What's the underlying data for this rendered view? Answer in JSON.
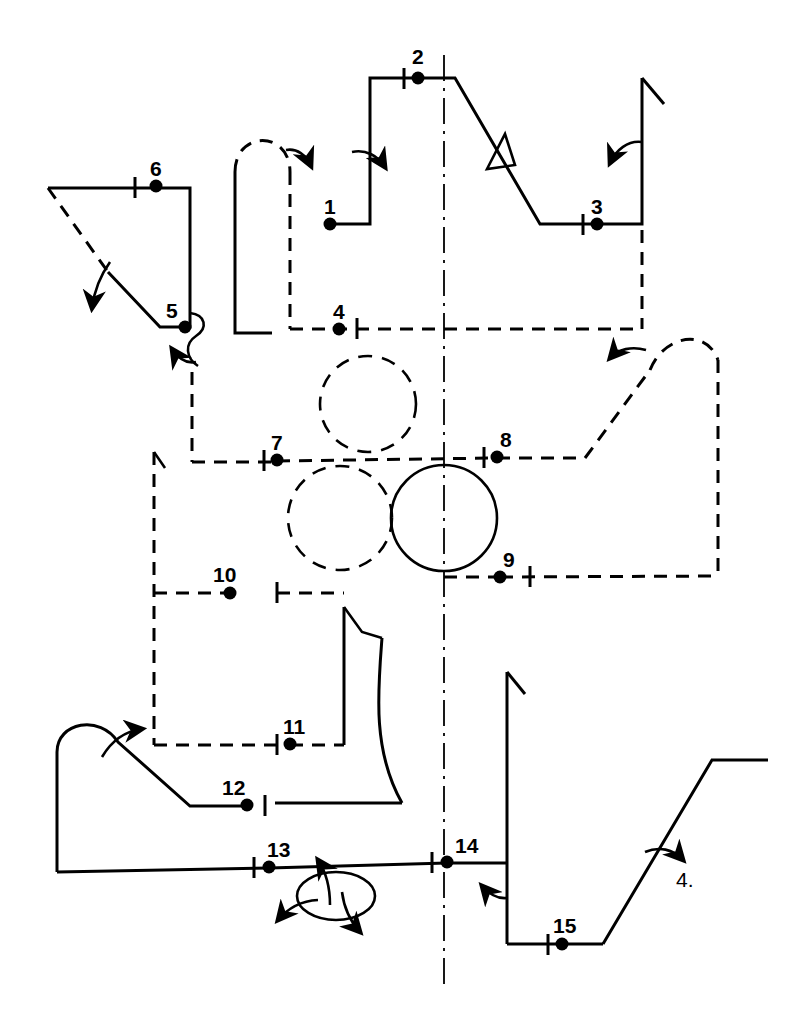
{
  "diagram": {
    "canvas": {
      "width": 803,
      "height": 1032
    },
    "colors": {
      "stroke": "#000000",
      "background": "#ffffff"
    },
    "centerline": {
      "name": "vertical-centerline",
      "x": 444,
      "y_start": 55,
      "y_end": 988,
      "style": "dash-dot"
    },
    "nodes": [
      {
        "id": "1",
        "label": "1",
        "x": 330,
        "y": 224,
        "label_x": 324,
        "label_y": 196
      },
      {
        "id": "2",
        "label": "2",
        "x": 418,
        "y": 78,
        "label_x": 412,
        "label_y": 46
      },
      {
        "id": "3",
        "label": "3",
        "x": 597,
        "y": 224,
        "label_x": 591,
        "label_y": 196
      },
      {
        "id": "4",
        "label": "4",
        "x": 339,
        "y": 329,
        "label_x": 333,
        "label_y": 301
      },
      {
        "id": "5",
        "label": "5",
        "x": 185,
        "y": 327,
        "label_x": 166,
        "label_y": 300
      },
      {
        "id": "6",
        "label": "6",
        "x": 156,
        "y": 186,
        "label_x": 150,
        "label_y": 158
      },
      {
        "id": "7",
        "label": "7",
        "x": 277,
        "y": 460,
        "label_x": 271,
        "label_y": 432
      },
      {
        "id": "8",
        "label": "8",
        "x": 497,
        "y": 457,
        "label_x": 500,
        "label_y": 429
      },
      {
        "id": "9",
        "label": "9",
        "x": 500,
        "y": 577,
        "label_x": 503,
        "label_y": 549
      },
      {
        "id": "10",
        "label": "10",
        "x": 230,
        "y": 593,
        "label_x": 213,
        "label_y": 564
      },
      {
        "id": "11",
        "label": "11",
        "x": 290,
        "y": 744,
        "label_x": 283,
        "label_y": 716
      },
      {
        "id": "12",
        "label": "12",
        "x": 247,
        "y": 805,
        "label_x": 222,
        "label_y": 777
      },
      {
        "id": "13",
        "label": "13",
        "x": 269,
        "y": 867,
        "label_x": 267,
        "label_y": 839
      },
      {
        "id": "14",
        "label": "14",
        "x": 447,
        "y": 862,
        "label_x": 455,
        "label_y": 835
      },
      {
        "id": "15",
        "label": "15",
        "x": 562,
        "y": 944,
        "label_x": 553,
        "label_y": 915
      }
    ],
    "reference_labels": [
      {
        "id": "ref-4",
        "label": "4.",
        "x": 676,
        "y": 869
      }
    ],
    "circles": [
      {
        "name": "dashed-circle-upper",
        "cx": 368,
        "cy": 404,
        "r": 48,
        "style": "dashed"
      },
      {
        "name": "dashed-circle-lower-left",
        "cx": 340,
        "cy": 518,
        "r": 52,
        "style": "dashed"
      },
      {
        "name": "solid-circle-main",
        "cx": 444,
        "cy": 518,
        "r": 53,
        "style": "solid"
      },
      {
        "name": "rotation-ellipse",
        "cx": 336,
        "cy": 896,
        "rx": 39,
        "ry": 24,
        "style": "solid"
      }
    ],
    "markers": {
      "triangle_valve": {
        "name": "triangle-marker",
        "x": 497,
        "y": 150
      },
      "tick_count": 13
    },
    "legend": {
      "solid_line": "solid link",
      "dashed_line": "dashed link",
      "dash_dot_line": "centerline",
      "dot": "joint node",
      "curved_arrow": "rotation direction"
    }
  }
}
